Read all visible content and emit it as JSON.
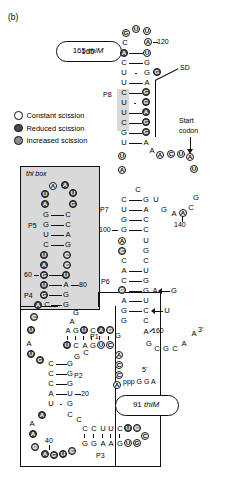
{
  "figure": {
    "panel_label": "(b)",
    "title_top": "165 thiM",
    "title_bottom": "91 thiM"
  },
  "legend": {
    "items": [
      {
        "label": "Constant scission",
        "swatch": "constant",
        "color": "#ffffff"
      },
      {
        "label": "Reduced scission",
        "swatch": "reduced",
        "color": "#4a4a4a"
      },
      {
        "label": "Increased scission",
        "swatch": "increased",
        "color": "#8d8d8d"
      }
    ]
  },
  "annotations": {
    "thi_box": "thi box",
    "sd": "SD",
    "start_codon_line1": "Start",
    "start_codon_line2": "codon",
    "five_prime": "5'",
    "ppp": "ppp G G A",
    "three_prime": "3'"
  },
  "helices": {
    "p1": "P1",
    "p2": "P2",
    "p3": "P3",
    "p4": "P4",
    "p5": "P5",
    "p6": "P6",
    "p7": "P7",
    "p8": "P8"
  },
  "position_labels": {
    "n20": "20",
    "n40": "40",
    "n60": "60",
    "n80": "80",
    "n100": "100",
    "n120": "120",
    "n140": "140",
    "n160": "160"
  },
  "insertions": [
    {
      "base": "G",
      "note": "inserted at P6 right strand A"
    },
    {
      "base": "U",
      "note": "inserted at P6 right strand C"
    }
  ],
  "structure": {
    "p8_hairpin_loop": [
      {
        "b": "G",
        "s": "constant",
        "circled": true
      },
      {
        "b": "U",
        "s": "constant",
        "circled": true
      },
      {
        "b": "U",
        "s": "constant",
        "circled": true
      },
      {
        "b": "A",
        "s": "constant",
        "circled": true
      },
      {
        "b": "C",
        "s": "plain",
        "circled": false
      }
    ],
    "p8_left": [
      {
        "b": "A",
        "s": "reduced",
        "circled": true
      },
      {
        "b": "C",
        "s": "plain",
        "circled": false
      },
      {
        "b": "U",
        "s": "plain",
        "circled": false
      },
      {
        "b": "U",
        "s": "plain",
        "circled": false
      },
      {
        "b": "C",
        "s": "plain",
        "circled": false
      },
      {
        "b": "U",
        "s": "plain",
        "circled": false
      },
      {
        "b": "U",
        "s": "plain",
        "circled": false
      },
      {
        "b": "C",
        "s": "plain",
        "circled": false
      },
      {
        "b": "G",
        "s": "plain",
        "circled": false
      },
      {
        "b": "U",
        "s": "plain",
        "circled": false
      }
    ],
    "p8_right": [
      {
        "b": "U",
        "s": "constant",
        "circled": true
      },
      {
        "b": "G",
        "s": "plain",
        "circled": false
      },
      {
        "b": "G",
        "s": "plain",
        "circled": false
      },
      {
        "b": "A",
        "s": "plain",
        "circled": false
      },
      {
        "b": "G",
        "s": "reduced",
        "circled": true
      },
      {
        "b": "G",
        "s": "reduced",
        "circled": true
      },
      {
        "b": "A",
        "s": "reduced",
        "circled": true
      },
      {
        "b": "G",
        "s": "reduced",
        "circled": true
      },
      {
        "b": "G",
        "s": "reduced",
        "circled": true
      },
      {
        "b": "A",
        "s": "plain",
        "circled": false
      }
    ],
    "start_codon_bases": [
      {
        "b": "A",
        "s": "plain"
      },
      {
        "b": "A",
        "s": "constant"
      },
      {
        "b": "C",
        "s": "constant"
      },
      {
        "b": "U",
        "s": "constant"
      },
      {
        "b": "A",
        "s": "constant"
      },
      {
        "b": "U",
        "s": "constant"
      }
    ],
    "p7_left": [
      "C",
      "U",
      "G",
      "G"
    ],
    "p7_right": [
      "G",
      "A",
      "C",
      "C"
    ],
    "p6_left": [
      "A",
      "C",
      "G",
      "A",
      "G"
    ],
    "p6_right": [
      "U",
      "G",
      "G",
      "U",
      "C"
    ],
    "p5_left": [
      "G",
      "G",
      "U",
      "C"
    ],
    "p5_right": [
      "C",
      "C",
      "A",
      "G"
    ],
    "p5_loop": [
      "A",
      "A",
      "U",
      "U",
      "A",
      "G"
    ],
    "p4_left": [
      "U",
      "A",
      "G",
      "U",
      "G",
      "C"
    ],
    "p4_right": [
      "C",
      "C",
      "U",
      "A",
      "G",
      "G"
    ],
    "p1_top": [
      "A",
      "G",
      "U",
      "C",
      "A",
      "G"
    ],
    "p1_bottom": [
      "U",
      "C",
      "A",
      "G",
      "U",
      "C"
    ],
    "p2_left": [
      "C",
      "C",
      "C",
      "A",
      "U"
    ],
    "p2_right": [
      "G",
      "G",
      "G",
      "U",
      "G"
    ],
    "p3_top": [
      "C",
      "C",
      "U",
      "U",
      "C"
    ],
    "p3_bottom": [
      "G",
      "G",
      "A",
      "A",
      "G"
    ],
    "three_prime_tail": [
      "G",
      "C",
      "G",
      "C",
      "A",
      "A"
    ]
  }
}
